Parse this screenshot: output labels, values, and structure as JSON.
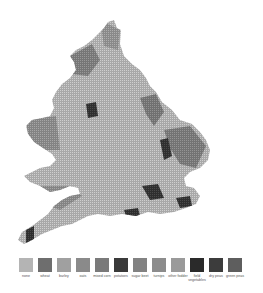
{
  "map": {
    "subject": "crop distribution map of England and Wales",
    "fill_color": "#9a9a9a",
    "grid_color": "#d8d8d8"
  },
  "legend": {
    "items": [
      {
        "label": "none",
        "color": "#b4b4b4"
      },
      {
        "label": "wheat",
        "color": "#6e6e6e"
      },
      {
        "label": "barley",
        "color": "#a0a0a0"
      },
      {
        "label": "oats",
        "color": "#8a8a8a"
      },
      {
        "label": "mixed corn",
        "color": "#7a7a7a"
      },
      {
        "label": "potatoes",
        "color": "#3a3a3a"
      },
      {
        "label": "sugar beet",
        "color": "#828282"
      },
      {
        "label": "turnips",
        "color": "#8c8c8c"
      },
      {
        "label": "other fodder",
        "color": "#9a9a9a"
      },
      {
        "label": "field vegetables",
        "color": "#2a2a2a"
      },
      {
        "label": "dry peas",
        "color": "#3c3c3c"
      },
      {
        "label": "green peas",
        "color": "#5e5e5e"
      }
    ]
  }
}
